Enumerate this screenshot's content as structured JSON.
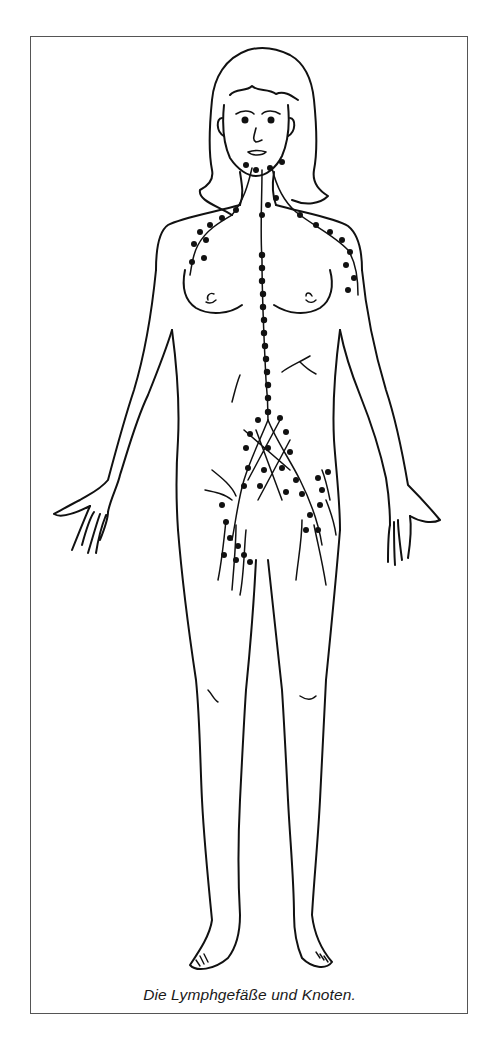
{
  "figure": {
    "caption": "Die Lymphgefäße und Knoten.",
    "line_color": "#111111",
    "node_color": "#111111",
    "frame_color": "#555555",
    "background": "#ffffff"
  }
}
